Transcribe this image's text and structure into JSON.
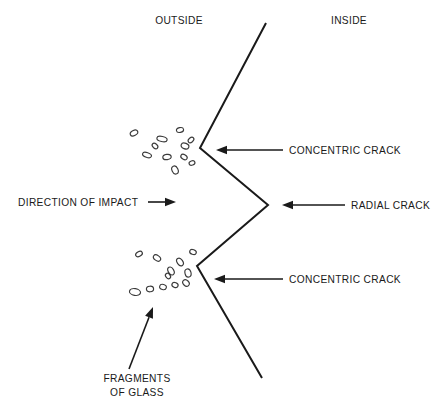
{
  "diagram": {
    "background_color": "#ffffff",
    "line_color": "#1a1a1a",
    "fragment_stroke_color": "#3a3a3a",
    "labels": {
      "outside": "OUTSIDE",
      "inside": "INSIDE",
      "direction_of_impact": "DIRECTION OF IMPACT",
      "concentric_crack_upper": "CONCENTRIC CRACK",
      "radial_crack": "RADIAL CRACK",
      "concentric_crack_lower": "CONCENTRIC CRACK",
      "fragments_line1": "FRAGMENTS",
      "fragments_line2": "OF GLASS"
    }
  },
  "chart_data": {
    "type": "diagram",
    "annotations": [
      {
        "id": "outside",
        "text": "OUTSIDE",
        "x": 179,
        "y": 20,
        "anchor": "middle"
      },
      {
        "id": "inside",
        "text": "INSIDE",
        "x": 349,
        "y": 20,
        "anchor": "middle"
      },
      {
        "id": "direction-of-impact",
        "text": "DIRECTION OF IMPACT",
        "x": 18,
        "y": 206,
        "anchor": "start"
      },
      {
        "id": "concentric-crack-upper",
        "text": "CONCENTRIC CRACK",
        "x": 289,
        "y": 154,
        "anchor": "start"
      },
      {
        "id": "radial-crack",
        "text": "RADIAL CRACK",
        "x": 351,
        "y": 209,
        "anchor": "start"
      },
      {
        "id": "concentric-crack-lower",
        "text": "CONCENTRIC CRACK",
        "x": 289,
        "y": 283,
        "anchor": "start"
      },
      {
        "id": "fragments-of-glass-line1",
        "text": "FRAGMENTS",
        "x": 137,
        "y": 382,
        "anchor": "middle"
      },
      {
        "id": "fragments-of-glass-line2",
        "text": "OF GLASS",
        "x": 137,
        "y": 396,
        "anchor": "middle"
      }
    ],
    "crack_profile": {
      "name": "zigzag crack profile",
      "points": [
        {
          "x": 266,
          "y": 23
        },
        {
          "x": 200,
          "y": 148
        },
        {
          "x": 268,
          "y": 205
        },
        {
          "x": 197,
          "y": 266
        },
        {
          "x": 262,
          "y": 378
        }
      ]
    },
    "leader_arrows": [
      {
        "id": "direction-of-impact-arrow",
        "from": {
          "x": 148,
          "y": 202
        },
        "to": {
          "x": 176,
          "y": 202
        },
        "direction": "right"
      },
      {
        "id": "concentric-crack-upper-arrow",
        "from": {
          "x": 283,
          "y": 150
        },
        "to": {
          "x": 216,
          "y": 150
        },
        "direction": "left"
      },
      {
        "id": "radial-crack-arrow",
        "from": {
          "x": 345,
          "y": 205
        },
        "to": {
          "x": 282,
          "y": 205
        },
        "direction": "left"
      },
      {
        "id": "concentric-crack-lower-arrow",
        "from": {
          "x": 283,
          "y": 279
        },
        "to": {
          "x": 214,
          "y": 279
        },
        "direction": "left"
      },
      {
        "id": "fragments-of-glass-arrow",
        "from": {
          "x": 129,
          "y": 369
        },
        "to": {
          "x": 153,
          "y": 307
        },
        "direction": "up-right"
      }
    ],
    "fragment_clusters": [
      {
        "id": "upper-fragment-cluster",
        "count": 11,
        "fragments": [
          {
            "cx": 134,
            "cy": 133,
            "rx": 4.0,
            "ry": 2.6,
            "rot": -28
          },
          {
            "cx": 162,
            "cy": 139,
            "rx": 5.2,
            "ry": 2.6,
            "rot": 12
          },
          {
            "cx": 180,
            "cy": 130,
            "rx": 3.6,
            "ry": 2.4,
            "rot": -12
          },
          {
            "cx": 185,
            "cy": 146,
            "rx": 4.0,
            "ry": 2.8,
            "rot": 22
          },
          {
            "cx": 147,
            "cy": 155,
            "rx": 4.6,
            "ry": 2.4,
            "rot": 18
          },
          {
            "cx": 167,
            "cy": 157,
            "rx": 4.2,
            "ry": 2.6,
            "rot": -8
          },
          {
            "cx": 184,
            "cy": 157,
            "rx": 3.4,
            "ry": 2.4,
            "rot": 30
          },
          {
            "cx": 175,
            "cy": 170,
            "rx": 4.2,
            "ry": 3.0,
            "rot": 65
          },
          {
            "cx": 191,
            "cy": 140,
            "rx": 3.2,
            "ry": 2.2,
            "rot": -40
          },
          {
            "cx": 155,
            "cy": 146,
            "rx": 3.2,
            "ry": 2.2,
            "rot": 40
          },
          {
            "cx": 192,
            "cy": 163,
            "rx": 3.0,
            "ry": 2.2,
            "rot": -20
          }
        ]
      },
      {
        "id": "lower-fragment-cluster",
        "count": 12,
        "fragments": [
          {
            "cx": 139,
            "cy": 254,
            "rx": 3.6,
            "ry": 2.4,
            "rot": -30
          },
          {
            "cx": 157,
            "cy": 258,
            "rx": 4.0,
            "ry": 2.6,
            "rot": 35
          },
          {
            "cx": 180,
            "cy": 262,
            "rx": 4.2,
            "ry": 2.8,
            "rot": 55
          },
          {
            "cx": 193,
            "cy": 252,
            "rx": 3.4,
            "ry": 2.4,
            "rot": 20
          },
          {
            "cx": 171,
            "cy": 271,
            "rx": 4.2,
            "ry": 2.8,
            "rot": 60
          },
          {
            "cx": 188,
            "cy": 273,
            "rx": 4.2,
            "ry": 3.0,
            "rot": 75
          },
          {
            "cx": 135,
            "cy": 292,
            "rx": 5.6,
            "ry": 3.4,
            "rot": 10
          },
          {
            "cx": 150,
            "cy": 289,
            "rx": 3.6,
            "ry": 2.8,
            "rot": -5
          },
          {
            "cx": 163,
            "cy": 287,
            "rx": 3.4,
            "ry": 2.6,
            "rot": 15
          },
          {
            "cx": 175,
            "cy": 285,
            "rx": 3.2,
            "ry": 2.4,
            "rot": 25
          },
          {
            "cx": 186,
            "cy": 283,
            "rx": 3.6,
            "ry": 2.8,
            "rot": 45
          },
          {
            "cx": 168,
            "cy": 276,
            "rx": 3.0,
            "ry": 2.2,
            "rot": 50
          }
        ]
      }
    ]
  }
}
